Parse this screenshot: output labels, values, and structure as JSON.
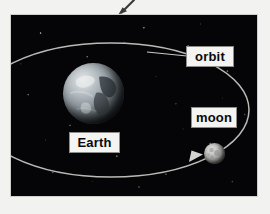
{
  "page": {
    "background_color": "#f2f2f0",
    "width": 270,
    "height": 214
  },
  "pointer": {
    "name": "annotation-arrow",
    "direction": "down-left",
    "color": "#3a3a3a"
  },
  "figure": {
    "name": "earth-moon-orbit-diagram",
    "space_background_color": "#050507",
    "border_color": "#cfcfcb",
    "orbit_line_color": "#c9cbc6"
  },
  "labels": {
    "orbit": "orbit",
    "moon": "moon",
    "earth": "Earth"
  },
  "bodies": {
    "earth": {
      "name": "Earth",
      "light_color": "#d8dde0",
      "shadow_color": "#0d1013"
    },
    "moon": {
      "name": "moon",
      "light_color": "#e2e2e0",
      "shadow_color": "#3a3a38"
    }
  }
}
